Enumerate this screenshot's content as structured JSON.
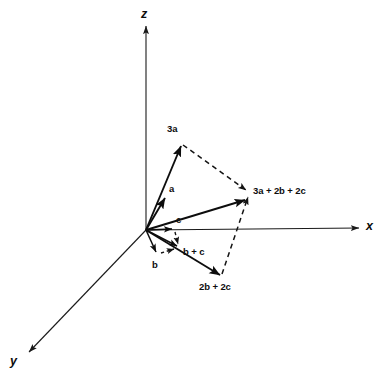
{
  "figure": {
    "type": "vector-diagram",
    "background_color": "#ffffff",
    "line_color": "#0d0d0d",
    "width": 380,
    "height": 379
  },
  "axes": [
    {
      "name": "z-axis",
      "label": "z",
      "label_x": 141,
      "label_y": 8,
      "from": [
        146,
        230
      ],
      "to": [
        146,
        26
      ]
    },
    {
      "name": "x-axis",
      "label": "x",
      "label_x": 366,
      "label_y": 221,
      "from": [
        146,
        230
      ],
      "to": [
        361,
        228
      ]
    },
    {
      "name": "y-axis",
      "label": "y",
      "label_x": 10,
      "label_y": 356,
      "from": [
        146,
        230
      ],
      "to": [
        27,
        354
      ]
    }
  ],
  "origin": {
    "x": 146,
    "y": 230
  },
  "vectors": [
    {
      "name": "vector-a",
      "label": "a",
      "label_x": 169,
      "label_y": 184,
      "from": [
        146,
        230
      ],
      "to": [
        166,
        196
      ],
      "style": "solid"
    },
    {
      "name": "vector-3a",
      "label": "3a",
      "label_x": 167,
      "label_y": 124,
      "from": [
        146,
        230
      ],
      "to": [
        182,
        143
      ],
      "style": "solid"
    },
    {
      "name": "vector-c",
      "label": "c",
      "label_x": 176,
      "label_y": 216,
      "from": [
        146,
        230
      ],
      "to": [
        175,
        229
      ],
      "style": "solid"
    },
    {
      "name": "vector-b",
      "label": "b",
      "label_x": 152,
      "label_y": 261,
      "from": [
        146,
        230
      ],
      "to": [
        158,
        254
      ],
      "style": "solid"
    },
    {
      "name": "vector-b-plus-c",
      "label": "b + c",
      "label_x": 184,
      "label_y": 247,
      "from": [
        146,
        230
      ],
      "to": [
        180,
        248
      ],
      "style": "solid"
    },
    {
      "name": "vector-2b-plus-2c",
      "label": "2b + 2c",
      "label_x": 199,
      "label_y": 282,
      "from": [
        146,
        230
      ],
      "to": [
        222,
        277
      ],
      "style": "solid"
    },
    {
      "name": "vector-resultant",
      "label": "3a + 2b + 2c",
      "label_x": 253,
      "label_y": 186,
      "from": [
        146,
        230
      ],
      "to": [
        247,
        199
      ],
      "style": "solid"
    }
  ],
  "construction_lines": [
    {
      "name": "dashed-3a-to-resultant",
      "from": [
        183,
        144
      ],
      "to": [
        248,
        192
      ],
      "style": "dashed"
    },
    {
      "name": "dashed-2b2c-to-resultant",
      "from": [
        222,
        275
      ],
      "to": [
        249,
        196
      ],
      "style": "dashed"
    },
    {
      "name": "dashed-c-to-bplusc",
      "from": [
        175,
        231
      ],
      "to": [
        178,
        246
      ],
      "style": "dashed-short"
    },
    {
      "name": "dashed-b-to-bplusc",
      "from": [
        160,
        253
      ],
      "to": [
        176,
        249
      ],
      "style": "dashed-short"
    }
  ],
  "labels": {
    "z": "z",
    "x": "x",
    "y": "y",
    "a": "a",
    "three_a": "3a",
    "b": "b",
    "c": "c",
    "b_plus_c": "b + c",
    "two_b_plus_two_c": "2b + 2c",
    "resultant": "3a + 2b + 2c"
  }
}
